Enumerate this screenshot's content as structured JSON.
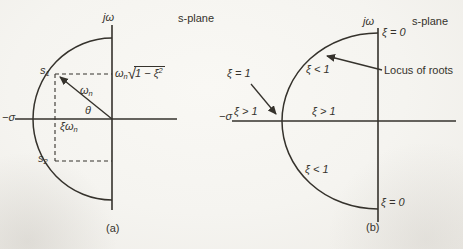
{
  "figure": {
    "ink_color": "#35322c",
    "background_color": "#f5f4f0"
  },
  "left_diagram": {
    "imag_axis_label": "jω",
    "plane_label": "s-plane",
    "real_axis_label": "−σ",
    "point_s1": {
      "base": "s",
      "sub": "1"
    },
    "point_s2": {
      "base": "s",
      "sub": "2"
    },
    "radius_label": {
      "base": "ω",
      "sub": "n"
    },
    "angle_label": "θ",
    "real_part_label": {
      "base": "ξω",
      "sub": "n"
    },
    "imag_part_label": {
      "base": "ω",
      "sub": "n",
      "radical_sign": "√",
      "radicand": "1 − ξ",
      "radicand_sup": "2"
    },
    "caption": "(a)"
  },
  "right_diagram": {
    "imag_axis_label": "jω",
    "plane_label": "s-plane",
    "real_axis_label": "−σ",
    "xi_zero_top": "ξ = 0",
    "xi_lt_one_top": "ξ < 1",
    "locus_label": "Locus of roots",
    "xi_eq_one": "ξ = 1",
    "xi_gt_one_left": "ξ > 1",
    "xi_gt_one_mid": "ξ > 1",
    "xi_lt_one_bottom": "ξ < 1",
    "xi_zero_bottom": "ξ = 0",
    "caption": "(b)"
  }
}
